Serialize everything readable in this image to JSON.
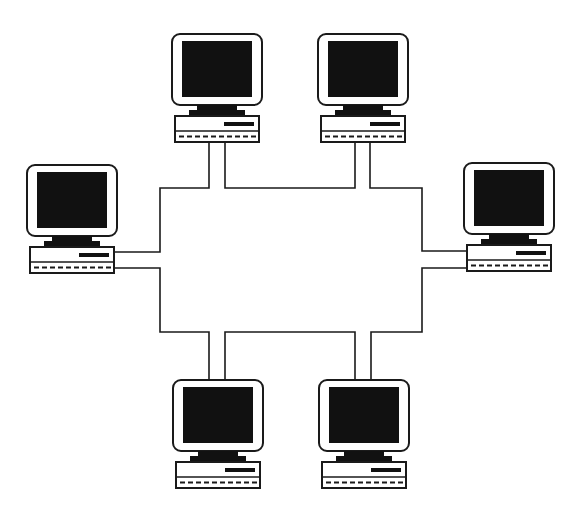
{
  "diagram": {
    "type": "network-topology",
    "description": "Six desktop computers connected to a rectangular ring cable",
    "colors": {
      "background": "#ffffff",
      "stroke": "#1a1a1a",
      "screen": "#111111",
      "case": "#ffffff"
    },
    "nodes": [
      {
        "id": "computer-top-left",
        "label": "Computer 1",
        "x": 172,
        "y": 34,
        "orientation": "bottom-port"
      },
      {
        "id": "computer-top-right",
        "label": "Computer 2",
        "x": 318,
        "y": 34,
        "orientation": "bottom-port"
      },
      {
        "id": "computer-right",
        "label": "Computer 3",
        "x": 464,
        "y": 163,
        "orientation": "left-port"
      },
      {
        "id": "computer-bottom-right",
        "label": "Computer 4",
        "x": 319,
        "y": 380,
        "orientation": "top-port"
      },
      {
        "id": "computer-bottom-left",
        "label": "Computer 5",
        "x": 173,
        "y": 380,
        "orientation": "top-port"
      },
      {
        "id": "computer-left",
        "label": "Computer 6",
        "x": 27,
        "y": 165,
        "orientation": "right-port"
      }
    ],
    "ring_path": "M209,142 L209,188 L160,188 L160,252 L115,252 M115,268 L160,268 L160,332 L209,332 L209,380 M225,380 L225,332 L355,332 L355,380 M371,380 L371,332 L422,332 L422,268 L467,268 M467,251 L422,251 L422,188 L370,188 L370,141 M355,141 L355,188 L225,188 L225,142"
  }
}
